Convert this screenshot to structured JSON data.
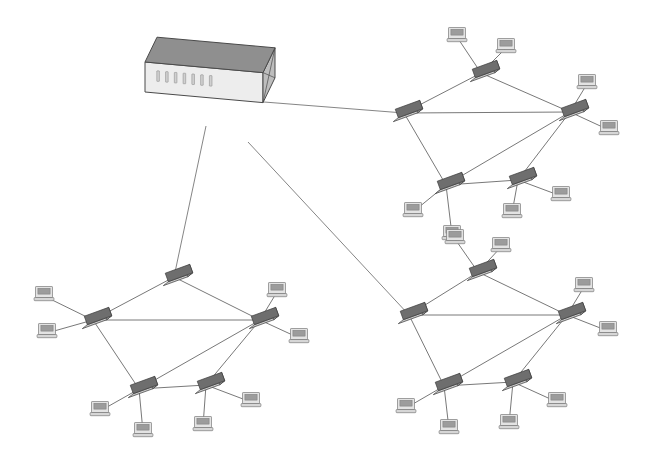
{
  "canvas": {
    "width": 655,
    "height": 464,
    "background": "#ffffff",
    "title": "Network Topology Diagram"
  },
  "style": {
    "link_color": "#555555",
    "link_width": 0.8,
    "uplink_color": "#666666",
    "uplink_width": 0.8,
    "server_top_face": "#8f8f8f",
    "server_front_face": "#ededed",
    "server_side_face": "#a8a8a8",
    "server_end_face": "#bdbdbd",
    "server_outline": "#4a4a4a",
    "server_port_color": "#d0d0d0",
    "server_port_outline": "#8a8a8a",
    "switch_top_face": "#6e6e6e",
    "switch_front_face": "#c9c9c9",
    "switch_end_face": "#9a9a9a",
    "switch_outline": "#3c3c3c",
    "pc_body_fill": "#e3e3e3",
    "pc_screen_fill": "#9c9c9c",
    "pc_outline": "#7a7a7a",
    "pc_base_fill": "#d6d6d6"
  },
  "server": {
    "name": "central-server",
    "label": "Central Server",
    "x": 145,
    "y": 62,
    "length": 118,
    "depth": 40,
    "height": 30,
    "port_count": 7
  },
  "uplinks": [
    {
      "name": "uplink-to-cluster-top-right",
      "from": "server",
      "to": "tr-w",
      "x1": 264,
      "y1": 102,
      "x2": 404,
      "y2": 113
    },
    {
      "name": "uplink-to-cluster-bottom-left",
      "from": "server",
      "to": "bl-n",
      "x1": 206,
      "y1": 126,
      "x2": 174,
      "y2": 277
    },
    {
      "name": "uplink-to-cluster-bottom-right",
      "from": "server",
      "to": "br-w",
      "x1": 248,
      "y1": 142,
      "x2": 409,
      "y2": 315
    }
  ],
  "clusters": [
    {
      "name": "cluster-top-right",
      "label": "Top Right Cluster",
      "switches": [
        {
          "id": "tr-n",
          "name": "switch-top",
          "label": "Switch TR-N",
          "x": 481,
          "y": 73,
          "angle": -20
        },
        {
          "id": "tr-w",
          "name": "switch-left",
          "label": "Switch TR-W",
          "x": 404,
          "y": 113,
          "angle": -20
        },
        {
          "id": "tr-e",
          "name": "switch-right",
          "label": "Switch TR-E",
          "x": 570,
          "y": 112,
          "angle": -20
        },
        {
          "id": "tr-sw",
          "name": "switch-bottom-left",
          "label": "Switch TR-SW",
          "x": 446,
          "y": 185,
          "angle": -20
        },
        {
          "id": "tr-se",
          "name": "switch-bottom-right",
          "label": "Switch TR-SE",
          "x": 518,
          "y": 180,
          "angle": -20
        }
      ],
      "links": [
        {
          "name": "link-tr-w-tr-n",
          "a": "tr-w",
          "b": "tr-n"
        },
        {
          "name": "link-tr-n-tr-e",
          "a": "tr-n",
          "b": "tr-e"
        },
        {
          "name": "link-tr-w-tr-e",
          "a": "tr-w",
          "b": "tr-e"
        },
        {
          "name": "link-tr-w-tr-sw",
          "a": "tr-w",
          "b": "tr-sw"
        },
        {
          "name": "link-tr-e-tr-sw",
          "a": "tr-e",
          "b": "tr-sw"
        },
        {
          "name": "link-tr-e-tr-se",
          "a": "tr-e",
          "b": "tr-se"
        },
        {
          "name": "link-tr-sw-tr-se",
          "a": "tr-sw",
          "b": "tr-se"
        }
      ],
      "workstations": [
        {
          "name": "pc-tr-n-1",
          "label": "Workstation",
          "x": 457,
          "y": 33,
          "host": "tr-n"
        },
        {
          "name": "pc-tr-n-2",
          "label": "Workstation",
          "x": 506,
          "y": 44,
          "host": "tr-n"
        },
        {
          "name": "pc-tr-e-1",
          "label": "Workstation",
          "x": 587,
          "y": 80,
          "host": "tr-e"
        },
        {
          "name": "pc-tr-e-2",
          "label": "Workstation",
          "x": 609,
          "y": 126,
          "host": "tr-e"
        },
        {
          "name": "pc-tr-sw-1",
          "label": "Workstation",
          "x": 413,
          "y": 208,
          "host": "tr-sw"
        },
        {
          "name": "pc-tr-sw-2",
          "label": "Workstation",
          "x": 452,
          "y": 231,
          "host": "tr-sw"
        },
        {
          "name": "pc-tr-se-1",
          "label": "Workstation",
          "x": 512,
          "y": 209,
          "host": "tr-se"
        },
        {
          "name": "pc-tr-se-2",
          "label": "Workstation",
          "x": 561,
          "y": 192,
          "host": "tr-se"
        }
      ]
    },
    {
      "name": "cluster-bottom-left",
      "label": "Bottom Left Cluster",
      "switches": [
        {
          "id": "bl-n",
          "name": "switch-top",
          "label": "Switch BL-N",
          "x": 174,
          "y": 277,
          "angle": -20
        },
        {
          "id": "bl-w",
          "name": "switch-left",
          "label": "Switch BL-W",
          "x": 93,
          "y": 320,
          "angle": -20
        },
        {
          "id": "bl-e",
          "name": "switch-right",
          "label": "Switch BL-E",
          "x": 260,
          "y": 320,
          "angle": -20
        },
        {
          "id": "bl-sw",
          "name": "switch-bottom-left",
          "label": "Switch BL-SW",
          "x": 139,
          "y": 389,
          "angle": -20
        },
        {
          "id": "bl-se",
          "name": "switch-bottom-right",
          "label": "Switch BL-SE",
          "x": 206,
          "y": 385,
          "angle": -20
        }
      ],
      "links": [
        {
          "name": "link-bl-w-bl-n",
          "a": "bl-w",
          "b": "bl-n"
        },
        {
          "name": "link-bl-n-bl-e",
          "a": "bl-n",
          "b": "bl-e"
        },
        {
          "name": "link-bl-w-bl-e",
          "a": "bl-w",
          "b": "bl-e"
        },
        {
          "name": "link-bl-w-bl-sw",
          "a": "bl-w",
          "b": "bl-sw"
        },
        {
          "name": "link-bl-e-bl-sw",
          "a": "bl-e",
          "b": "bl-sw"
        },
        {
          "name": "link-bl-e-bl-se",
          "a": "bl-e",
          "b": "bl-se"
        },
        {
          "name": "link-bl-sw-bl-se",
          "a": "bl-sw",
          "b": "bl-se"
        }
      ],
      "workstations": [
        {
          "name": "pc-bl-w-1",
          "label": "Workstation",
          "x": 44,
          "y": 292,
          "host": "bl-w"
        },
        {
          "name": "pc-bl-w-2",
          "label": "Workstation",
          "x": 47,
          "y": 329,
          "host": "bl-w"
        },
        {
          "name": "pc-bl-e-1",
          "label": "Workstation",
          "x": 277,
          "y": 288,
          "host": "bl-e"
        },
        {
          "name": "pc-bl-e-2",
          "label": "Workstation",
          "x": 299,
          "y": 334,
          "host": "bl-e"
        },
        {
          "name": "pc-bl-sw-1",
          "label": "Workstation",
          "x": 100,
          "y": 407,
          "host": "bl-sw"
        },
        {
          "name": "pc-bl-sw-2",
          "label": "Workstation",
          "x": 143,
          "y": 428,
          "host": "bl-sw"
        },
        {
          "name": "pc-bl-se-1",
          "label": "Workstation",
          "x": 203,
          "y": 422,
          "host": "bl-se"
        },
        {
          "name": "pc-bl-se-2",
          "label": "Workstation",
          "x": 251,
          "y": 398,
          "host": "bl-se"
        }
      ]
    },
    {
      "name": "cluster-bottom-right",
      "label": "Bottom Right Cluster",
      "switches": [
        {
          "id": "br-n",
          "name": "switch-top",
          "label": "Switch BR-N",
          "x": 478,
          "y": 272,
          "angle": -20
        },
        {
          "id": "br-w",
          "name": "switch-left",
          "label": "Switch BR-W",
          "x": 409,
          "y": 315,
          "angle": -20
        },
        {
          "id": "br-e",
          "name": "switch-right",
          "label": "Switch BR-E",
          "x": 567,
          "y": 315,
          "angle": -20
        },
        {
          "id": "br-sw",
          "name": "switch-bottom-left",
          "label": "Switch BR-SW",
          "x": 444,
          "y": 386,
          "angle": -20
        },
        {
          "id": "br-se",
          "name": "switch-bottom-right",
          "label": "Switch BR-SE",
          "x": 513,
          "y": 382,
          "angle": -20
        }
      ],
      "links": [
        {
          "name": "link-br-w-br-n",
          "a": "br-w",
          "b": "br-n"
        },
        {
          "name": "link-br-n-br-e",
          "a": "br-n",
          "b": "br-e"
        },
        {
          "name": "link-br-w-br-e",
          "a": "br-w",
          "b": "br-e"
        },
        {
          "name": "link-br-w-br-sw",
          "a": "br-w",
          "b": "br-sw"
        },
        {
          "name": "link-br-e-br-sw",
          "a": "br-e",
          "b": "br-sw"
        },
        {
          "name": "link-br-e-br-se",
          "a": "br-e",
          "b": "br-se"
        },
        {
          "name": "link-br-sw-br-se",
          "a": "br-sw",
          "b": "br-se"
        }
      ],
      "workstations": [
        {
          "name": "pc-br-n-1",
          "label": "Workstation",
          "x": 455,
          "y": 235,
          "host": "br-n"
        },
        {
          "name": "pc-br-n-2",
          "label": "Workstation",
          "x": 501,
          "y": 243,
          "host": "br-n"
        },
        {
          "name": "pc-br-e-1",
          "label": "Workstation",
          "x": 584,
          "y": 283,
          "host": "br-e"
        },
        {
          "name": "pc-br-e-2",
          "label": "Workstation",
          "x": 608,
          "y": 327,
          "host": "br-e"
        },
        {
          "name": "pc-br-sw-1",
          "label": "Workstation",
          "x": 406,
          "y": 404,
          "host": "br-sw"
        },
        {
          "name": "pc-br-sw-2",
          "label": "Workstation",
          "x": 449,
          "y": 425,
          "host": "br-sw"
        },
        {
          "name": "pc-br-se-1",
          "label": "Workstation",
          "x": 509,
          "y": 420,
          "host": "br-se"
        },
        {
          "name": "pc-br-se-2",
          "label": "Workstation",
          "x": 557,
          "y": 398,
          "host": "br-se"
        }
      ]
    }
  ]
}
